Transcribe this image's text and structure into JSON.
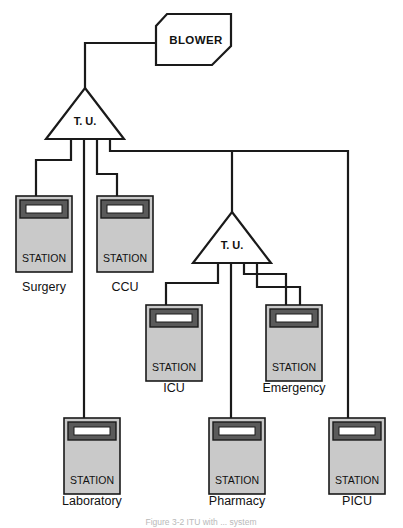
{
  "figure": {
    "caption": "Figure 3-2  ITU with ... system"
  },
  "colors": {
    "line": "#1a1a1a",
    "station_body": "#c9c9c9",
    "station_header": "#5a5a5a",
    "station_slot": "#ffffff",
    "background": "#ffffff",
    "caption": "#b9b9b9"
  },
  "blower": {
    "label": "BLOWER",
    "name": "blower-unit"
  },
  "transfer_units": [
    {
      "id": "tu-1",
      "label": "T. U.",
      "outputs": 4
    },
    {
      "id": "tu-2",
      "label": "T. U.",
      "outputs": 4
    }
  ],
  "station_word": "STATION",
  "stations": [
    {
      "id": "station-surgery",
      "label": "Surgery",
      "x": 16,
      "y": 196,
      "parent": "tu-1"
    },
    {
      "id": "station-ccu",
      "label": "CCU",
      "x": 97,
      "y": 196,
      "parent": "tu-1"
    },
    {
      "id": "station-icu",
      "label": "ICU",
      "x": 146,
      "y": 305,
      "parent": "tu-2"
    },
    {
      "id": "station-emergency",
      "label": "Emergency",
      "x": 266,
      "y": 305,
      "parent": "tu-2"
    },
    {
      "id": "station-laboratory",
      "label": "Laboratory",
      "x": 64,
      "y": 418,
      "parent": "tu-1"
    },
    {
      "id": "station-pharmacy",
      "label": "Pharmacy",
      "x": 209,
      "y": 418,
      "parent": "tu-2"
    },
    {
      "id": "station-picu",
      "label": "PICU",
      "x": 329,
      "y": 418,
      "parent": "tu-1"
    }
  ],
  "connections": [
    {
      "from": "blower",
      "to": "tu-1",
      "kind": "trunk"
    },
    {
      "from": "tu-1",
      "to": "station-surgery",
      "kind": "branch"
    },
    {
      "from": "tu-1",
      "to": "station-ccu",
      "kind": "branch"
    },
    {
      "from": "tu-1",
      "to": "station-laboratory",
      "kind": "branch"
    },
    {
      "from": "tu-1",
      "to": "tu-2",
      "kind": "trunk"
    },
    {
      "from": "tu-1",
      "to": "station-picu",
      "kind": "branch"
    },
    {
      "from": "tu-2",
      "to": "station-icu",
      "kind": "branch"
    },
    {
      "from": "tu-2",
      "to": "station-pharmacy",
      "kind": "branch"
    },
    {
      "from": "tu-2",
      "to": "station-emergency",
      "kind": "branch"
    }
  ]
}
